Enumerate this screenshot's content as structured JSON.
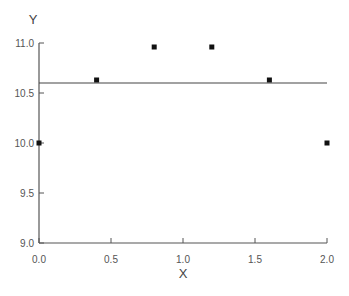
{
  "chart_data": {
    "type": "scatter",
    "title": "",
    "xlabel": "X",
    "ylabel": "Y",
    "xlim": [
      0.0,
      2.0
    ],
    "ylim": [
      9.0,
      11.0
    ],
    "x_ticks": [
      "0.0",
      "0.5",
      "1.0",
      "1.5",
      "2.0"
    ],
    "y_ticks": [
      "9.0",
      "9.5",
      "10.0",
      "10.5",
      "11.0"
    ],
    "grid": false,
    "legend": null,
    "series": [
      {
        "name": "points",
        "marker": "square",
        "x": [
          0.0,
          0.4,
          0.8,
          1.2,
          1.6,
          2.0
        ],
        "y": [
          10.0,
          10.63,
          10.96,
          10.96,
          10.63,
          10.0
        ]
      }
    ],
    "reference_line": {
      "orientation": "horizontal",
      "y": 10.6
    }
  },
  "colors": {
    "axis": "#555555",
    "marker": "#111111",
    "line": "#444444"
  }
}
